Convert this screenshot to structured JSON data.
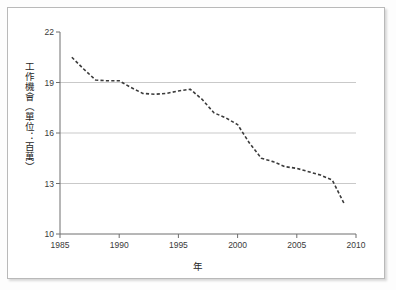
{
  "figure": {
    "background_color": "#ffffff",
    "frame_color": "#b9b9b9",
    "line_color": "#3b3b3b",
    "grid_color": "#c9c9c9",
    "axis_color": "#6e6e6e"
  },
  "chart_data": {
    "type": "line",
    "title": "",
    "xlabel": "年",
    "ylabel": "工作機會（單位：百萬）",
    "xlim": [
      1985,
      2010
    ],
    "ylim": [
      10,
      22
    ],
    "xticks": [
      1985,
      1990,
      1995,
      2000,
      2005,
      2010
    ],
    "xticklabels": [
      "1985",
      "1990",
      "1995",
      "2000",
      "2005",
      "2010"
    ],
    "yticks": [
      10,
      13,
      16,
      19,
      22
    ],
    "yticklabels": [
      "10",
      "13",
      "16",
      "19",
      "22"
    ],
    "grid": "horizontal",
    "gridlines_at": [
      13,
      16,
      19
    ],
    "legend": null,
    "linestyle": "dashed",
    "series": [
      {
        "name": "工作機會",
        "x": [
          1986,
          1987,
          1988,
          1989,
          1990,
          1991,
          1992,
          1993,
          1994,
          1995,
          1996,
          1997,
          1998,
          1999,
          2000,
          2001,
          2002,
          2003,
          2004,
          2005,
          2006,
          2007,
          2008,
          2009
        ],
        "values": [
          20.5,
          19.8,
          19.15,
          19.1,
          19.1,
          18.7,
          18.35,
          18.3,
          18.35,
          18.5,
          18.6,
          18.0,
          17.2,
          16.9,
          16.5,
          15.4,
          14.5,
          14.3,
          14.0,
          13.9,
          13.7,
          13.5,
          13.2,
          11.8
        ]
      }
    ]
  },
  "axis_titles": {
    "y": "工作機會（單位：百萬）",
    "x": "年"
  }
}
